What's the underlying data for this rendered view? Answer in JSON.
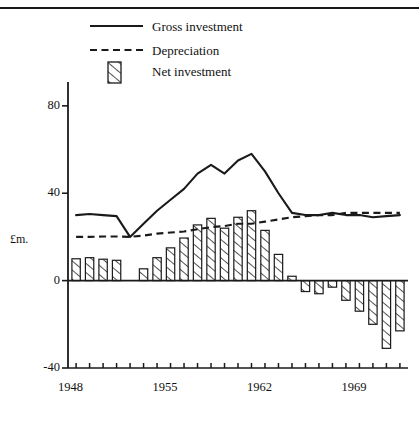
{
  "chart_data": {
    "type": "bar",
    "title": "",
    "subtitle": "",
    "xlabel": "",
    "ylabel": "£m.",
    "ylim": [
      -40,
      90
    ],
    "xlim": [
      1947.4,
      1972.6
    ],
    "grid": false,
    "legend_position": "top-left",
    "x": [
      1948,
      1949,
      1950,
      1951,
      1952,
      1953,
      1954,
      1955,
      1956,
      1957,
      1958,
      1959,
      1960,
      1961,
      1962,
      1963,
      1964,
      1965,
      1966,
      1967,
      1968,
      1969,
      1970,
      1971,
      1972
    ],
    "xtick_labels": [
      "1948",
      "1955",
      "1962",
      "1969"
    ],
    "xtick_label_values": [
      1948,
      1955,
      1962,
      1969
    ],
    "ytick_labels": [
      "80",
      "40",
      "0",
      "-40"
    ],
    "ytick_values": [
      80,
      40,
      0,
      -40
    ],
    "series": [
      {
        "name": "Gross investment",
        "style": "solid-line",
        "values": [
          30,
          30.5,
          30,
          29.5,
          20,
          26,
          32,
          37,
          42,
          49,
          53,
          49,
          55,
          58,
          50,
          40,
          31,
          30,
          30,
          31,
          30,
          30,
          29,
          29.5,
          30
        ]
      },
      {
        "name": "Depreciation",
        "style": "dashed-line",
        "values": [
          20,
          20,
          20.2,
          20.2,
          20,
          20.6,
          21.5,
          22,
          22.5,
          23.5,
          24.5,
          25,
          26,
          26,
          27,
          28,
          29,
          29.5,
          30,
          30,
          31,
          31,
          31,
          31,
          31
        ]
      },
      {
        "name": "Net investment",
        "style": "hatched-bar",
        "values": [
          10,
          10.5,
          9.8,
          9.3,
          0,
          5.4,
          10.5,
          15,
          19.5,
          25.5,
          28.5,
          24,
          29,
          32,
          23,
          12,
          2,
          -5,
          -6,
          -3,
          -9,
          -14,
          -20,
          -31,
          -23
        ]
      }
    ],
    "legend": [
      {
        "label": "Gross investment",
        "marker": "solid-line"
      },
      {
        "label": "Depreciation",
        "marker": "dashed-line"
      },
      {
        "label": "Net investment",
        "marker": "hatched-swatch"
      }
    ]
  }
}
